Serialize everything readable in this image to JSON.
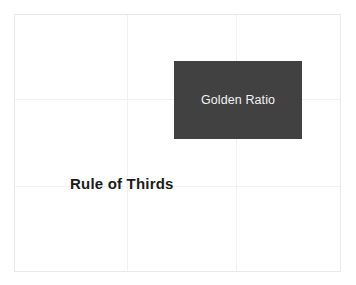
{
  "canvas": {
    "width": 356,
    "height": 285,
    "background_color": "#ffffff",
    "frame_border_color": "#e9e9e9"
  },
  "grid": {
    "name": "rule-of-thirds-grid",
    "line_color": "#f1f1f1",
    "vertical_lines": [
      {
        "id": "vline-1",
        "label": "left third"
      },
      {
        "id": "vline-2",
        "label": "right third"
      }
    ],
    "horizontal_lines": [
      {
        "id": "hline-1",
        "label": "upper third"
      },
      {
        "id": "hline-2",
        "label": "lower third"
      }
    ]
  },
  "blocks": {
    "golden_ratio": {
      "label": "Golden Ratio",
      "fill_color": "#414141",
      "text_color": "#f2f2f2"
    }
  },
  "labels": {
    "rule_of_thirds": {
      "text": "Rule of Thirds",
      "text_color": "#1b1b1b"
    }
  }
}
